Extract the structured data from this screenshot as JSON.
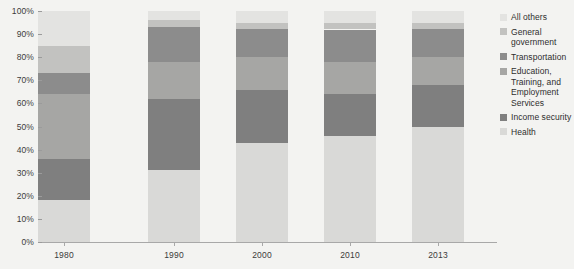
{
  "chart_data": {
    "type": "bar",
    "stacked": true,
    "normalized_percent": true,
    "title": "",
    "subtitle": "",
    "xlabel": "",
    "ylabel": "",
    "categories": [
      "1980",
      "1990",
      "2000",
      "2010",
      "2013"
    ],
    "ylim": [
      0,
      100
    ],
    "ytick_labels": [
      "0%",
      "10%",
      "20%",
      "30%",
      "40%",
      "50%",
      "60%",
      "70%",
      "80%",
      "90%",
      "100%"
    ],
    "ytick_values": [
      0,
      10,
      20,
      30,
      40,
      50,
      60,
      70,
      80,
      90,
      100
    ],
    "grid": false,
    "legend_position": "right",
    "legend_order_top_to_bottom": [
      "All others",
      "General government",
      "Transportation",
      "Education, Training, and Employment Services",
      "Income security",
      "Health"
    ],
    "stack_order_bottom_to_top": [
      "Health",
      "Income security",
      "Education, Training, and Employment Services",
      "Transportation",
      "General government",
      "All others"
    ],
    "series": [
      {
        "name": "Health",
        "color": "#d9d9d7",
        "values": [
          18,
          31,
          43,
          46,
          50
        ]
      },
      {
        "name": "Income security",
        "color": "#7f7f7f",
        "values": [
          18,
          31,
          23,
          18,
          18
        ]
      },
      {
        "name": "Education, Training, and Employment Services",
        "color": "#a6a6a4",
        "values": [
          28,
          16,
          14,
          14,
          12
        ]
      },
      {
        "name": "Transportation",
        "color": "#8c8c8c",
        "values": [
          9,
          15,
          12,
          14,
          12
        ]
      },
      {
        "name": "General government",
        "color": "#c2c2c0",
        "values": [
          12,
          3,
          3,
          3,
          3
        ]
      },
      {
        "name": "All others",
        "color": "#e3e3e1",
        "values": [
          15,
          4,
          5,
          5,
          5
        ]
      }
    ]
  },
  "legend": {
    "items": [
      {
        "label": "All others",
        "color": "#e3e3e1"
      },
      {
        "label": "General government",
        "color": "#c2c2c0"
      },
      {
        "label": "Transportation",
        "color": "#8c8c8c"
      },
      {
        "label": "Education, Training, and Employment Services",
        "color": "#a6a6a4"
      },
      {
        "label": "Income security",
        "color": "#7f7f7f"
      },
      {
        "label": "Health",
        "color": "#d9d9d7"
      }
    ]
  },
  "colors": {
    "background": "#f3f3f1",
    "axis": "#a8a8a8",
    "text": "#3b3b3b"
  }
}
